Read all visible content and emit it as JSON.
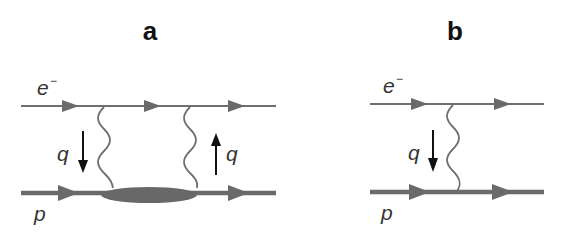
{
  "panels": [
    {
      "id": "a",
      "label": "a",
      "electron_label": "e",
      "electron_charge": "−",
      "proton_label": "p",
      "momentum_labels": [
        "q",
        "q"
      ],
      "momentum_directions": [
        "down",
        "up"
      ],
      "photon_count": 2,
      "has_blob": true
    },
    {
      "id": "b",
      "label": "b",
      "electron_label": "e",
      "electron_charge": "−",
      "proton_label": "p",
      "momentum_labels": [
        "q"
      ],
      "momentum_directions": [
        "down"
      ],
      "photon_count": 1,
      "has_blob": false
    }
  ],
  "colors": {
    "line": "#6e6e6e",
    "blob": "#686868",
    "arrow": "#111111"
  }
}
